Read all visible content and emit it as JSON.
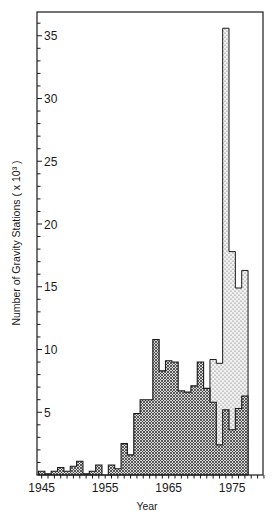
{
  "chart_data": {
    "type": "bar",
    "subtype": "stacked-histogram",
    "title": "",
    "xlabel": "Year",
    "ylabel": "Number of Gravity Stations ( x 10³ )",
    "ylim": [
      0,
      37
    ],
    "xlim": [
      1945,
      1980
    ],
    "grid": false,
    "legend": null,
    "x_ticks": [
      "1945",
      "1955",
      "1965",
      "1975"
    ],
    "y_ticks": [
      "5",
      "10",
      "15",
      "20",
      "25",
      "30",
      "35"
    ],
    "categories": [
      1945,
      1946,
      1947,
      1948,
      1949,
      1950,
      1951,
      1952,
      1953,
      1954,
      1955,
      1956,
      1957,
      1958,
      1959,
      1960,
      1961,
      1962,
      1963,
      1964,
      1965,
      1966,
      1967,
      1968,
      1969,
      1970,
      1971,
      1972,
      1973,
      1974,
      1975,
      1976,
      1977
    ],
    "series": [
      {
        "name": "crosshatched (lower)",
        "pattern": "crosshatch",
        "values": [
          0.3,
          0.1,
          0.3,
          0.6,
          0.3,
          0.7,
          1.1,
          0.1,
          0.3,
          0.8,
          0.0,
          0.8,
          0.5,
          2.5,
          1.6,
          4.9,
          6.0,
          6.0,
          10.8,
          8.3,
          9.1,
          9.0,
          6.7,
          6.6,
          7.1,
          9.0,
          6.9,
          5.8,
          2.4,
          5.2,
          3.6,
          5.3,
          6.3
        ]
      },
      {
        "name": "dotted (total envelope)",
        "pattern": "dots",
        "start_year": 1972,
        "totals": [
          9.2,
          8.9,
          35.6,
          17.8,
          14.9,
          16.3
        ]
      }
    ]
  },
  "labels": {
    "xlabel": "Year",
    "ylabel": "Number of Gravity Stations ( x 10³ )"
  }
}
